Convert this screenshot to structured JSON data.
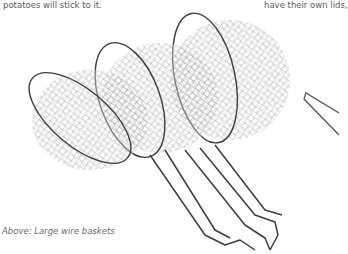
{
  "page": {
    "text_left": "potatoes will stick to it.",
    "text_right": "have their own lids,",
    "caption": "Above: Large wire baskets"
  },
  "image": {
    "subject": "wire-mesh-frying-baskets",
    "count": 3,
    "colors": {
      "background": "#ffffff",
      "wire": "#6a6a6a",
      "rim": "#3c3c3c",
      "text": "#5a5a5a"
    }
  }
}
